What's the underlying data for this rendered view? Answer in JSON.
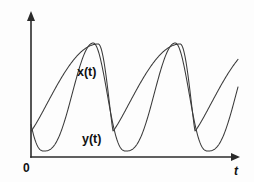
{
  "figure": {
    "background_color": "#fdfdfd",
    "curve_color": "#3a3a3a",
    "axis_color": "#2b2b2b",
    "label_color": "#111111"
  },
  "labels": {
    "x_curve": "x(t)",
    "y_curve": "y(t)",
    "origin": "0",
    "t_axis": "t"
  },
  "chart_data": {
    "type": "line",
    "title": "",
    "xlabel": "t",
    "ylabel": "",
    "grid": false,
    "legend": "inline-annotations",
    "annotations": [
      {
        "text": "x(t)",
        "x_px": 88,
        "y_px": 73
      },
      {
        "text": "y(t)",
        "x_px": 93,
        "y_px": 140
      },
      {
        "text": "0",
        "x_px": 27,
        "y_px": 168
      },
      {
        "text": "t",
        "x_px": 237,
        "y_px": 171
      }
    ],
    "axes": {
      "origin_px": [
        31,
        157
      ],
      "x_axis_end_px": [
        240,
        157
      ],
      "y_axis_top_px": [
        31,
        12
      ],
      "x_axis_arrow": true,
      "y_axis_arrow": true,
      "tick_labels_x": [],
      "tick_labels_y": []
    },
    "period_px": 82,
    "cycles_visible": 3,
    "series": [
      {
        "name": "x(t)",
        "peak_t_px": [
          31,
          113,
          195
        ],
        "trough_t_px": [
          72,
          154,
          236
        ],
        "peak_level_px": 44,
        "trough_level_px": 131,
        "shape": "broad-peak-slow-rise-fast-fall"
      },
      {
        "name": "y(t)",
        "peak_t_px": [
          44,
          126,
          208
        ],
        "trough_t_px": [
          85,
          167,
          249
        ],
        "peak_level_px": 43,
        "trough_level_px": 151,
        "shape": "narrow-sharp-peak-lagging"
      }
    ]
  }
}
